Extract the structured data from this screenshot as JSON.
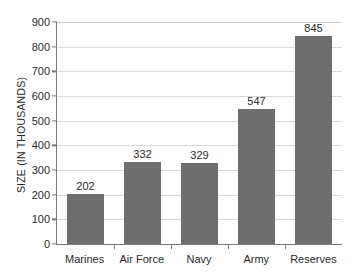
{
  "chart_data": {
    "type": "bar",
    "title": "",
    "subtitle": "",
    "xlabel": "",
    "ylabel": "SIZE (IN THOUSANDS)",
    "categories": [
      "Marines",
      "Air Force",
      "Navy",
      "Army",
      "Reserves"
    ],
    "values": [
      202,
      332,
      329,
      547,
      845
    ],
    "data_labels": [
      "202",
      "332",
      "329",
      "547",
      "845"
    ],
    "ylim": [
      0,
      900
    ],
    "ytick_step": 100,
    "ytick_labels": [
      "900",
      "800",
      "700",
      "600",
      "500",
      "400",
      "300",
      "200",
      "100",
      "0"
    ],
    "ytick_values": [
      900,
      800,
      700,
      600,
      500,
      400,
      300,
      200,
      100,
      0
    ],
    "grid": "horizontal",
    "legend": "none",
    "orientation": "vertical",
    "colors": {
      "bar_fill": "#6e6e6e",
      "gridline": "#d8d8d8",
      "axis_line": "#7a7a7a",
      "text": "#2b2b2b",
      "background": "#ffffff"
    }
  }
}
